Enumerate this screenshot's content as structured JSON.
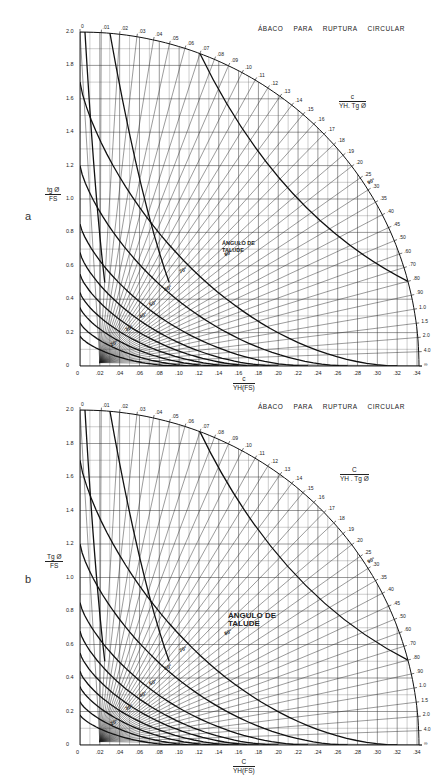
{
  "charts": {
    "a": {
      "panel_label": "a",
      "title": "ÁBACO PARA RUPTURA CIRCULAR",
      "y_axis_label": {
        "num": "tg Ø",
        "den": "FS"
      },
      "x_axis_label": {
        "num": "c",
        "den": "YH(FS)"
      },
      "arc_label": {
        "num": "c",
        "den": "YH. Tg Ø"
      },
      "slope_label": "ÁNGULO DE TALUDE"
    },
    "b": {
      "panel_label": "b",
      "title": "ÁBACO PARA RUPTURA CIRCULAR",
      "y_axis_label": {
        "num": "Tg Ø",
        "den": "FS"
      },
      "x_axis_label": {
        "num": "C",
        "den": "YH(FS)"
      },
      "arc_label": {
        "num": "C",
        "den": "YH . Tg Ø"
      },
      "slope_label": "ÁNGULO DE TALUDE"
    }
  },
  "chart_data": [
    {
      "type": "line",
      "panel": "a",
      "title": "ÁBACO PARA RUPTURA CIRCULAR",
      "xlabel": "c / (YH(FS))",
      "ylabel": "tg Ø / FS",
      "xlim": [
        0,
        0.35
      ],
      "ylim": [
        0,
        2.0
      ],
      "x_ticks": [
        "0",
        ".02",
        ".04",
        ".06",
        ".08",
        ".10",
        ".12",
        ".14",
        ".16",
        ".18",
        ".20",
        ".22",
        ".24",
        ".26",
        ".28",
        ".30",
        ".32",
        ".34"
      ],
      "y_ticks": [
        "0",
        "0.2",
        "0.4",
        "0.6",
        "0.8",
        "1.0",
        "1.2",
        "1.4",
        "1.6",
        "1.8",
        "2.0"
      ],
      "arc_scale_label": "c / (YH. Tg Ø)",
      "arc_ticks": [
        "0",
        ".01",
        ".02",
        ".03",
        ".04",
        ".05",
        ".06",
        ".07",
        ".08",
        ".09",
        ".10",
        ".11",
        ".12",
        ".13",
        ".14",
        ".15",
        ".16",
        ".17",
        ".18",
        ".19",
        ".20",
        ".25",
        ".30",
        ".35",
        ".40",
        ".45",
        ".50",
        ".60",
        ".70",
        ".80",
        ".90",
        "1.0",
        "1.5",
        "2.0",
        "4.0",
        "∞"
      ],
      "slope_angle_labels": [
        "20°",
        "30°",
        "40°",
        "50°",
        "60°",
        "70°",
        "80°",
        "90°"
      ],
      "grid": true,
      "annotations": [
        "ÁNGULO DE TALUDE"
      ]
    },
    {
      "type": "line",
      "panel": "b",
      "title": "ÁBACO PARA RUPTURA CIRCULAR",
      "xlabel": "C / (YH(FS))",
      "ylabel": "Tg Ø / FS",
      "xlim": [
        0,
        0.35
      ],
      "ylim": [
        0,
        2.0
      ],
      "x_ticks": [
        "0",
        ".02",
        ".04",
        ".06",
        ".08",
        ".10",
        ".12",
        ".14",
        ".16",
        ".18",
        ".20",
        ".22",
        ".24",
        ".26",
        ".28",
        ".30",
        ".32",
        ".34"
      ],
      "y_ticks": [
        "0",
        "0.2",
        "0.4",
        "0.6",
        "0.8",
        "1.0",
        "1.2",
        "1.4",
        "1.6",
        "1.8",
        "2.0"
      ],
      "arc_scale_label": "C / (YH . Tg Ø)",
      "arc_ticks": [
        "0",
        ".01",
        ".02",
        ".03",
        ".04",
        ".05",
        ".06",
        ".07",
        ".08",
        ".09",
        ".10",
        ".11",
        ".12",
        ".13",
        ".14",
        ".15",
        ".16",
        ".17",
        ".18",
        ".19",
        ".20",
        ".25",
        ".30",
        ".35",
        ".40",
        ".45",
        ".50",
        ".60",
        ".70",
        ".80",
        ".90",
        "1.0",
        "1.5",
        "2.0",
        "4.0",
        "∞"
      ],
      "slope_angle_labels": [
        "20°",
        "30°",
        "40°",
        "50°",
        "60°",
        "70°",
        "80°",
        "90°"
      ],
      "grid": true,
      "annotations": [
        "ÁNGULO DE TALUDE"
      ]
    }
  ]
}
